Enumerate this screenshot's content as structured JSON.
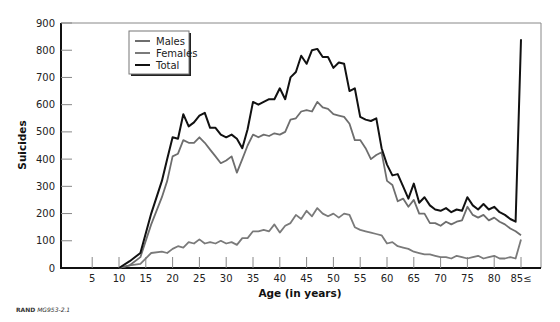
{
  "chart_data": {
    "type": "line",
    "title": "",
    "xlabel": "Age (in years)",
    "ylabel": "Suicides",
    "xlim": [
      0,
      88
    ],
    "ylim": [
      0,
      900
    ],
    "grid": false,
    "legend_position": "upper-left",
    "x_ticks": [
      5,
      10,
      15,
      20,
      25,
      30,
      35,
      40,
      45,
      50,
      55,
      60,
      65,
      70,
      75,
      80,
      85
    ],
    "x_tick_labels": [
      "5",
      "10",
      "15",
      "20",
      "25",
      "30",
      "35",
      "40",
      "45",
      "50",
      "55",
      "60",
      "65",
      "70",
      "75",
      "80",
      "85≤"
    ],
    "y_ticks": [
      0,
      100,
      200,
      300,
      400,
      500,
      600,
      700,
      800,
      900
    ],
    "y_tick_labels": [
      "0",
      "100",
      "200",
      "300",
      "400",
      "500",
      "600",
      "700",
      "800",
      "900"
    ],
    "x": [
      10,
      12,
      14,
      16,
      18,
      19,
      20,
      21,
      22,
      23,
      24,
      25,
      26,
      27,
      28,
      29,
      30,
      31,
      32,
      33,
      34,
      35,
      36,
      37,
      38,
      39,
      40,
      41,
      42,
      43,
      44,
      45,
      46,
      47,
      48,
      49,
      50,
      51,
      52,
      53,
      54,
      55,
      56,
      57,
      58,
      59,
      60,
      61,
      62,
      63,
      64,
      65,
      66,
      67,
      68,
      69,
      70,
      71,
      72,
      73,
      74,
      75,
      76,
      77,
      78,
      79,
      80,
      81,
      82,
      83,
      84,
      85
    ],
    "series": [
      {
        "name": "Males",
        "color": "#6e6e6e",
        "values": [
          0,
          10,
          40,
          160,
          260,
          320,
          410,
          420,
          470,
          460,
          460,
          480,
          460,
          435,
          410,
          385,
          395,
          410,
          350,
          400,
          450,
          490,
          480,
          490,
          485,
          495,
          490,
          500,
          545,
          550,
          575,
          580,
          575,
          610,
          590,
          585,
          565,
          560,
          555,
          530,
          470,
          470,
          440,
          400,
          415,
          425,
          320,
          305,
          245,
          255,
          225,
          250,
          200,
          200,
          165,
          165,
          155,
          170,
          160,
          170,
          175,
          225,
          195,
          185,
          195,
          175,
          185,
          170,
          160,
          145,
          135,
          120
        ],
        "legend_label": "Males"
      },
      {
        "name": "Females",
        "color": "#7a7a7a",
        "values": [
          0,
          10,
          15,
          55,
          60,
          55,
          70,
          80,
          75,
          95,
          90,
          105,
          90,
          95,
          90,
          100,
          90,
          95,
          85,
          110,
          110,
          135,
          135,
          140,
          135,
          160,
          130,
          155,
          165,
          195,
          180,
          210,
          190,
          220,
          200,
          190,
          200,
          185,
          200,
          195,
          150,
          140,
          135,
          130,
          125,
          120,
          90,
          95,
          80,
          75,
          70,
          60,
          55,
          50,
          50,
          45,
          40,
          40,
          35,
          45,
          40,
          35,
          40,
          45,
          35,
          40,
          45,
          35,
          35,
          40,
          35,
          105
        ],
        "legend_label": "Females"
      },
      {
        "name": "Total",
        "color": "#111111",
        "values": [
          0,
          25,
          55,
          200,
          320,
          400,
          480,
          475,
          565,
          520,
          535,
          560,
          570,
          515,
          515,
          490,
          480,
          490,
          475,
          440,
          510,
          610,
          600,
          610,
          620,
          620,
          660,
          620,
          700,
          720,
          780,
          750,
          800,
          805,
          775,
          775,
          735,
          755,
          750,
          650,
          660,
          555,
          545,
          540,
          550,
          440,
          380,
          340,
          345,
          300,
          255,
          310,
          240,
          260,
          230,
          215,
          210,
          220,
          205,
          215,
          210,
          260,
          230,
          215,
          235,
          215,
          225,
          205,
          195,
          180,
          170,
          840
        ],
        "legend_label": "Total"
      }
    ]
  },
  "legend": {
    "items": [
      {
        "label": "Males"
      },
      {
        "label": "Females"
      },
      {
        "label": "Total"
      }
    ]
  },
  "axes": {
    "x_title": "Age (in years)",
    "y_title": "Suicides"
  },
  "footer": {
    "org": "RAND",
    "code": "MG953-2.1"
  }
}
